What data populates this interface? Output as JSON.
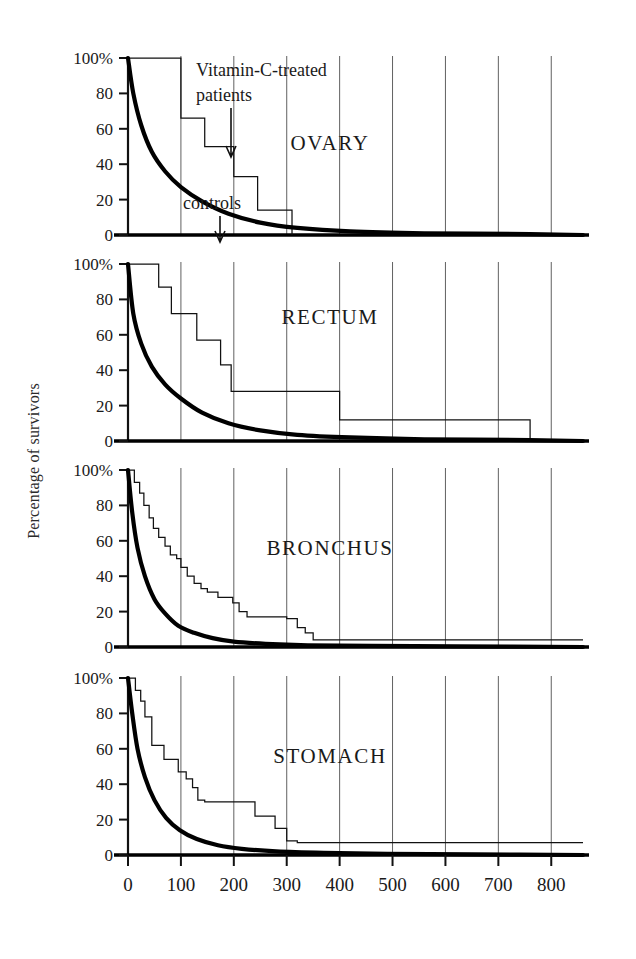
{
  "figure": {
    "ylabel": "Percentage of survivors",
    "annotations": {
      "treated": "Vitamin-C-treated patients",
      "treated_line1": "Vitamin-C-treated",
      "treated_line2": "patients",
      "controls": "controls"
    },
    "colors": {
      "treated_curve": "#111111",
      "control_curve": "#000000",
      "grid": "#444444",
      "axis": "#111111"
    }
  },
  "chart_data": [
    {
      "type": "line",
      "title": "OVARY",
      "xlabel": "",
      "ylabel": "Percentage of survivors",
      "xlim": [
        0,
        860
      ],
      "ylim": [
        0,
        100
      ],
      "xticks": [
        0,
        100,
        200,
        300,
        400,
        500,
        600,
        700,
        800
      ],
      "yticks": [
        0,
        20,
        40,
        60,
        80,
        100
      ],
      "ytick_labels": [
        "0",
        "20",
        "40",
        "60",
        "80",
        "100%"
      ],
      "grid": "vertical-at-x-ticks",
      "legend": "inline-annotations",
      "series": [
        {
          "name": "Vitamin-C-treated patients",
          "style": "step",
          "x": [
            0,
            100,
            100,
            145,
            145,
            200,
            200,
            245,
            245,
            310,
            310
          ],
          "y": [
            100,
            100,
            66,
            66,
            50,
            50,
            33,
            33,
            14,
            14,
            0
          ]
        },
        {
          "name": "controls",
          "style": "smooth-decay",
          "x": [
            0,
            10,
            25,
            45,
            70,
            100,
            140,
            190,
            250,
            320,
            420,
            560,
            760,
            860
          ],
          "y": [
            100,
            80,
            62,
            47,
            36,
            27,
            19,
            12,
            7,
            4,
            2,
            1,
            0.5,
            0
          ]
        }
      ]
    },
    {
      "type": "line",
      "title": "RECTUM",
      "xlabel": "",
      "ylabel": "Percentage of survivors",
      "xlim": [
        0,
        860
      ],
      "ylim": [
        0,
        100
      ],
      "xticks": [
        0,
        100,
        200,
        300,
        400,
        500,
        600,
        700,
        800
      ],
      "yticks": [
        0,
        20,
        40,
        60,
        80,
        100
      ],
      "ytick_labels": [
        "0",
        "20",
        "40",
        "60",
        "80",
        "100%"
      ],
      "grid": "vertical-at-x-ticks",
      "series": [
        {
          "name": "Vitamin-C-treated patients",
          "style": "step",
          "x": [
            0,
            58,
            58,
            82,
            82,
            130,
            130,
            175,
            175,
            195,
            195,
            400,
            400,
            760,
            760
          ],
          "y": [
            100,
            100,
            87,
            87,
            72,
            72,
            57,
            57,
            43,
            43,
            28,
            28,
            12,
            12,
            0
          ]
        },
        {
          "name": "controls",
          "style": "smooth-decay",
          "x": [
            0,
            10,
            25,
            45,
            70,
            100,
            140,
            190,
            250,
            320,
            420,
            560,
            760,
            860
          ],
          "y": [
            100,
            72,
            55,
            42,
            32,
            24,
            16,
            10,
            6,
            3.5,
            2,
            1,
            0.5,
            0
          ]
        }
      ]
    },
    {
      "type": "line",
      "title": "BRONCHUS",
      "xlabel": "",
      "ylabel": "Percentage of survivors",
      "xlim": [
        0,
        860
      ],
      "ylim": [
        0,
        100
      ],
      "xticks": [
        0,
        100,
        200,
        300,
        400,
        500,
        600,
        700,
        800
      ],
      "yticks": [
        0,
        20,
        40,
        60,
        80,
        100
      ],
      "ytick_labels": [
        "0",
        "20",
        "40",
        "60",
        "80",
        "100%"
      ],
      "grid": "vertical-at-x-ticks",
      "series": [
        {
          "name": "Vitamin-C-treated patients",
          "style": "step",
          "x": [
            0,
            12,
            12,
            22,
            22,
            30,
            30,
            40,
            40,
            48,
            48,
            58,
            58,
            70,
            70,
            80,
            80,
            92,
            92,
            100,
            100,
            112,
            112,
            125,
            125,
            138,
            138,
            150,
            150,
            170,
            170,
            198,
            198,
            210,
            210,
            225,
            225,
            300,
            300,
            320,
            320,
            335,
            335,
            350,
            350,
            860
          ],
          "y": [
            100,
            100,
            93,
            93,
            87,
            87,
            80,
            80,
            73,
            73,
            67,
            67,
            62,
            62,
            57,
            57,
            52,
            52,
            50,
            50,
            45,
            45,
            40,
            40,
            36,
            36,
            33,
            33,
            31,
            31,
            28,
            28,
            25,
            25,
            20,
            20,
            17,
            17,
            16,
            16,
            11,
            11,
            8,
            8,
            4,
            4
          ]
        },
        {
          "name": "controls",
          "style": "smooth-decay",
          "x": [
            0,
            8,
            18,
            32,
            50,
            70,
            95,
            125,
            160,
            200,
            260,
            340,
            460,
            620,
            860
          ],
          "y": [
            100,
            76,
            56,
            40,
            27,
            19,
            12,
            8,
            5,
            3,
            1.8,
            1,
            0.6,
            0.3,
            0
          ]
        }
      ]
    },
    {
      "type": "line",
      "title": "STOMACH",
      "xlabel": "",
      "ylabel": "Percentage of survivors",
      "xlim": [
        0,
        860
      ],
      "ylim": [
        0,
        100
      ],
      "xticks": [
        0,
        100,
        200,
        300,
        400,
        500,
        600,
        700,
        800
      ],
      "yticks": [
        0,
        20,
        40,
        60,
        80,
        100
      ],
      "ytick_labels": [
        "0",
        "20",
        "40",
        "60",
        "80",
        "100%"
      ],
      "grid": "vertical-at-x-ticks",
      "series": [
        {
          "name": "Vitamin-C-treated patients",
          "style": "step",
          "x": [
            0,
            14,
            14,
            24,
            24,
            32,
            32,
            45,
            45,
            68,
            68,
            95,
            95,
            110,
            110,
            122,
            122,
            132,
            132,
            145,
            145,
            240,
            240,
            278,
            278,
            300,
            300,
            320,
            320,
            860
          ],
          "y": [
            100,
            100,
            93,
            93,
            87,
            87,
            78,
            78,
            62,
            62,
            54,
            54,
            47,
            47,
            43,
            43,
            38,
            38,
            31,
            31,
            30,
            30,
            22,
            22,
            15,
            15,
            8,
            8,
            7,
            7
          ]
        },
        {
          "name": "controls",
          "style": "smooth-decay",
          "x": [
            0,
            8,
            18,
            32,
            50,
            72,
            98,
            130,
            170,
            215,
            280,
            370,
            490,
            650,
            860
          ],
          "y": [
            100,
            80,
            60,
            44,
            31,
            21,
            14,
            9,
            5.5,
            3.5,
            2,
            1.2,
            0.7,
            0.3,
            0
          ]
        }
      ]
    }
  ]
}
